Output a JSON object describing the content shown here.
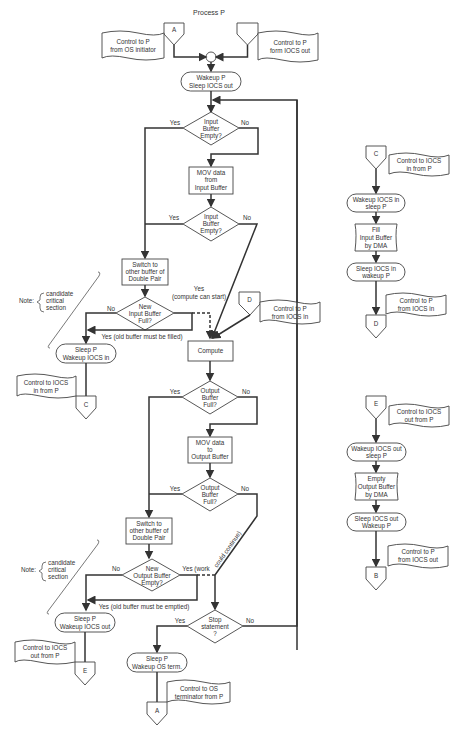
{
  "title": "Process P",
  "main": {
    "connector_a_top": "A",
    "ann_start_a": [
      "Control to P",
      "from OS initiator"
    ],
    "ann_start_b": [
      "Control to P",
      "form IOCS out"
    ],
    "wakeup_p": [
      "Wakeup P",
      "Sleep IOCS out"
    ],
    "input_empty_1": [
      "Input",
      "Buffer",
      "Empty?"
    ],
    "mov_input": [
      "MOV data",
      "from",
      "Input Buffer"
    ],
    "input_empty_2": [
      "Input",
      "Buffer",
      "Empty?"
    ],
    "switch_input": [
      "Switch to",
      "other buffer of",
      "Double Pair"
    ],
    "new_input_full": [
      "New",
      "Input Buffer",
      "Full?"
    ],
    "sleep_p_in": [
      "Sleep P",
      "Wakeup IOCS in"
    ],
    "ann_c": [
      "Control to IOCS",
      "in from P"
    ],
    "connector_c": "C",
    "connector_d": "D",
    "ann_d": [
      "Control to P",
      "from IOCS in"
    ],
    "compute": "Compute",
    "output_full_1": [
      "Output",
      "Buffer",
      "Full?"
    ],
    "mov_output": [
      "MOV data",
      "to",
      "Output Buffer"
    ],
    "output_full_2": [
      "Output",
      "Buffer",
      "Full?"
    ],
    "switch_output": [
      "Switch to",
      "other buffer of",
      "Double Pair"
    ],
    "new_output_empty": [
      "New",
      "Output Buffer",
      "Empty?"
    ],
    "sleep_p_out": [
      "Sleep P",
      "Wakeup IOCS out"
    ],
    "ann_e": [
      "Control to IOCS",
      "out from P"
    ],
    "connector_e": "E",
    "stop": [
      "Stop",
      "statement",
      "?"
    ],
    "sleep_p_term": [
      "Sleep P",
      "Wakeup OS term."
    ],
    "ann_a_end": [
      "Control to OS",
      "terminator from P"
    ],
    "connector_a_end": "A",
    "note_1": [
      "candidate",
      "critical",
      "section"
    ],
    "note_2": [
      "candidate",
      "critical",
      "section"
    ],
    "note_label": "Note:",
    "labels": {
      "yes": "Yes",
      "no": "No",
      "yes_compute": "(compute can start)",
      "yes_old_filled": "Yes (old buffer must be filled)",
      "yes_work": "Yes (work",
      "could_continue": "could continue)",
      "yes_old_emptied": "Yes (old buffer must be emptied)"
    }
  },
  "iocs_in": {
    "connector_top": "C",
    "ann_top": [
      "Control to IOCS",
      "in from P"
    ],
    "wakeup": [
      "Wakeup IOCS in",
      "sleep P"
    ],
    "fill": [
      "Fill",
      "Input Buffer",
      "by DMA"
    ],
    "sleep": [
      "Sleep IOCS in",
      "wakeup P"
    ],
    "ann_bottom": [
      "Control to P",
      "from IOCS in"
    ],
    "connector_bottom": "D"
  },
  "iocs_out": {
    "connector_top": "E",
    "ann_top": [
      "Control to IOCS",
      "out from P"
    ],
    "wakeup": [
      "Wakeup IOCS out",
      "sleep P"
    ],
    "empty": [
      "Empty",
      "Output Buffer",
      "by DMA"
    ],
    "sleep": [
      "Sleep IOCS out",
      "Wakeup P"
    ],
    "ann_bottom": [
      "Control to P",
      "from IOCS out"
    ],
    "connector_bottom": "B"
  }
}
